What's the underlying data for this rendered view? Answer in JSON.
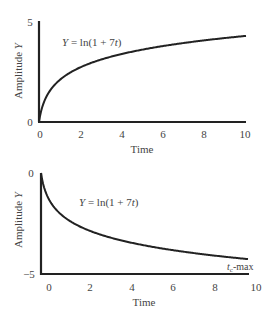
{
  "chart_data": [
    {
      "type": "line",
      "title": "",
      "annotation": "Y = ln(1+7t)",
      "xlabel": "Time",
      "ylabel": "Amplitude Y",
      "xticks": [
        "0",
        "2",
        "4",
        "6",
        "8",
        "10"
      ],
      "yticks": [
        "0",
        "5"
      ],
      "xlim": [
        0,
        10
      ],
      "ylim": [
        0,
        5
      ],
      "grid": false,
      "series": [
        {
          "name": "Y = ln(1+7t)",
          "x": [
            0,
            0.5,
            1,
            2,
            3,
            4,
            5,
            6,
            7,
            8,
            9,
            10
          ],
          "values": [
            0,
            1.5,
            2.08,
            2.71,
            3.09,
            3.37,
            3.58,
            3.76,
            3.91,
            4.04,
            4.16,
            4.26
          ]
        }
      ]
    },
    {
      "type": "line",
      "title": "",
      "annotation": "Y = ln(1+7t)",
      "annotation2": "t_c-max",
      "xlabel": "Time",
      "ylabel": "Amplitude Y",
      "xticks": [
        "0",
        "2",
        "4",
        "6",
        "8",
        "10"
      ],
      "yticks": [
        "0",
        "-5"
      ],
      "xlim": [
        -0.45,
        10
      ],
      "ylim": [
        -5,
        0
      ],
      "grid": false,
      "series": [
        {
          "name": "Y = -ln(1+7t)",
          "x": [
            -0.45,
            0.05,
            0.55,
            1.55,
            2.55,
            3.55,
            4.55,
            5.55,
            6.55,
            7.55,
            8.55,
            9.55
          ],
          "values": [
            0,
            -1.5,
            -2.08,
            -2.71,
            -3.09,
            -3.37,
            -3.58,
            -3.76,
            -3.91,
            -4.04,
            -4.16,
            -4.26
          ]
        }
      ]
    }
  ],
  "top": {
    "ytick_top": "5",
    "ytick_bottom": "0",
    "xticks": [
      "0",
      "2",
      "4",
      "6",
      "8",
      "10"
    ],
    "ylabel": "Amplitude ",
    "ylabel_var": "Y",
    "xlabel": "Time",
    "eq_var": "Y",
    "eq_rest": " = ln(1 + 7",
    "eq_t": "t",
    "eq_close": ")"
  },
  "bottom": {
    "ytick_top": "0",
    "ytick_bottom": "−5",
    "xticks": [
      "0",
      "2",
      "4",
      "6",
      "8",
      "10"
    ],
    "ylabel": "Amplitude ",
    "ylabel_var": "Y",
    "xlabel": "Time",
    "eq_var": "Y",
    "eq_rest": " = ln(1 + 7",
    "eq_t": "t",
    "eq_close": ")",
    "marker_t": "t",
    "marker_sub": "c",
    "marker_rest": "-max"
  },
  "colors": {
    "line": "#222222",
    "axis": "#222222",
    "text": "#444444"
  }
}
